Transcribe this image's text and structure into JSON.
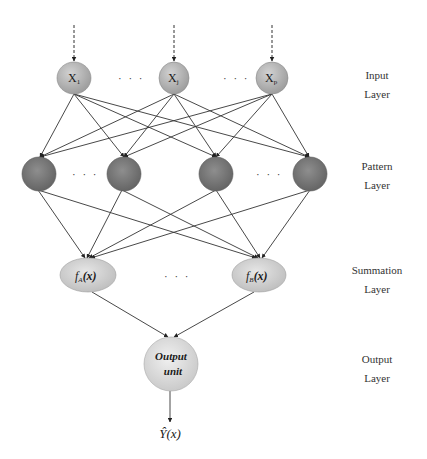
{
  "diagram": {
    "layers": [
      {
        "id": "input",
        "label_line1": "Input",
        "label_line2": "Layer"
      },
      {
        "id": "pattern",
        "label_line1": "Pattern",
        "label_line2": "Layer"
      },
      {
        "id": "summation",
        "label_line1": "Summation",
        "label_line2": "Layer"
      },
      {
        "id": "output",
        "label_line1": "Output",
        "label_line2": "Layer"
      }
    ],
    "input_nodes": [
      {
        "id": "x1",
        "label": "X",
        "subscript": "1"
      },
      {
        "id": "xj",
        "label": "X",
        "subscript": "j"
      },
      {
        "id": "xp",
        "label": "X",
        "subscript": "p"
      }
    ],
    "pattern_nodes": [
      {
        "id": "p1"
      },
      {
        "id": "p2"
      },
      {
        "id": "p3"
      },
      {
        "id": "p4"
      }
    ],
    "summation_nodes": [
      {
        "id": "fA",
        "label": "f",
        "subscript": "A",
        "suffix": "(x)"
      },
      {
        "id": "fB",
        "label": "f",
        "subscript": "B",
        "suffix": "(x)"
      }
    ],
    "output_node": {
      "line1": "Output",
      "line2": "unit"
    },
    "output_label": "Ŷ(x)",
    "ellipsis": "· · ·",
    "colors": {
      "input_fill": "#a9a9a9",
      "pattern_fill": "#7b7b7b",
      "summation_fill": "#cfcfcf",
      "output_fill": "#dcdcdc",
      "edge": "#333333"
    }
  }
}
